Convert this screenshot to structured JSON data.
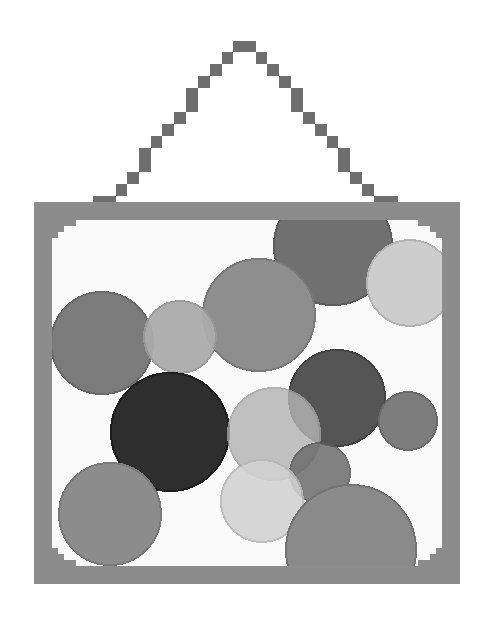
{
  "scene": {
    "description": "Pixel-art hanging picture frame containing overlapping gray circles",
    "width": 494,
    "height": 627,
    "background": "#ffffff"
  },
  "wire": {
    "color": "#6e6e6e",
    "blocks": [
      [
        233,
        41,
        23,
        11
      ],
      [
        222,
        52,
        11,
        12
      ],
      [
        210,
        64,
        12,
        12
      ],
      [
        198,
        76,
        12,
        12
      ],
      [
        186,
        88,
        12,
        24
      ],
      [
        174,
        112,
        12,
        12
      ],
      [
        162,
        124,
        12,
        12
      ],
      [
        151,
        136,
        11,
        12
      ],
      [
        139,
        148,
        12,
        24
      ],
      [
        127,
        172,
        12,
        12
      ],
      [
        116,
        184,
        11,
        12
      ],
      [
        93,
        196,
        23,
        6
      ],
      [
        256,
        52,
        11,
        12
      ],
      [
        267,
        64,
        12,
        12
      ],
      [
        279,
        76,
        12,
        12
      ],
      [
        291,
        88,
        12,
        24
      ],
      [
        303,
        112,
        12,
        12
      ],
      [
        315,
        124,
        12,
        12
      ],
      [
        327,
        136,
        11,
        12
      ],
      [
        338,
        148,
        12,
        24
      ],
      [
        350,
        172,
        12,
        12
      ],
      [
        362,
        184,
        12,
        12
      ],
      [
        374,
        196,
        24,
        6
      ]
    ]
  },
  "frame": {
    "color": "#8c8c8c",
    "outer": [
      34,
      202,
      426,
      382
    ],
    "inner": [
      52,
      220,
      390,
      346
    ],
    "inner_fill": "#fafafa",
    "corner_steps": 12
  },
  "circles": [
    {
      "name": "circle-top-center",
      "cx": 333,
      "cy": 246,
      "r": 59,
      "fill": "#707070",
      "stroke": "#5e5e5e",
      "opacity": 1
    },
    {
      "name": "circle-top-right-light",
      "cx": 410,
      "cy": 283,
      "r": 43,
      "fill": "#cdcdcd",
      "stroke": "#b4b4b4",
      "opacity": 1
    },
    {
      "name": "circle-mid-large",
      "cx": 259,
      "cy": 315,
      "r": 56,
      "fill": "#8e8e8e",
      "stroke": "#7a7a7a",
      "opacity": 1
    },
    {
      "name": "circle-left",
      "cx": 102,
      "cy": 343,
      "r": 51,
      "fill": "#7b7b7b",
      "stroke": "#6a6a6a",
      "opacity": 1
    },
    {
      "name": "circle-left-light",
      "cx": 180,
      "cy": 337,
      "r": 36,
      "fill": "#ababab",
      "stroke": "#999999",
      "opacity": 0.95
    },
    {
      "name": "circle-dark",
      "cx": 170,
      "cy": 432,
      "r": 59,
      "fill": "#2e2e2e",
      "stroke": "#1e1e1e",
      "opacity": 1
    },
    {
      "name": "circle-dark-gray",
      "cx": 337,
      "cy": 398,
      "r": 48,
      "fill": "#555555",
      "stroke": "#444444",
      "opacity": 1
    },
    {
      "name": "circle-small-right",
      "cx": 408,
      "cy": 421,
      "r": 29,
      "fill": "#7c7c7c",
      "stroke": "#6a6a6a",
      "opacity": 1
    },
    {
      "name": "circle-bottom-left",
      "cx": 110,
      "cy": 514,
      "r": 51,
      "fill": "#8c8c8c",
      "stroke": "#7a7a7a",
      "opacity": 1
    },
    {
      "name": "circle-center-light",
      "cx": 274,
      "cy": 434,
      "r": 46,
      "fill": "#b4b4b4",
      "stroke": "#a0a0a0",
      "opacity": 0.82
    },
    {
      "name": "circle-lower-mid",
      "cx": 320,
      "cy": 473,
      "r": 30,
      "fill": "#6c6c6c",
      "stroke": "#5c5c5c",
      "opacity": 0.85
    },
    {
      "name": "circle-lower-light",
      "cx": 262,
      "cy": 501,
      "r": 41,
      "fill": "#d2d2d2",
      "stroke": "#b8b8b8",
      "opacity": 0.88
    },
    {
      "name": "circle-bottom-big",
      "cx": 351,
      "cy": 550,
      "r": 65,
      "fill": "#8a8a8a",
      "stroke": "#747474",
      "opacity": 1
    }
  ]
}
